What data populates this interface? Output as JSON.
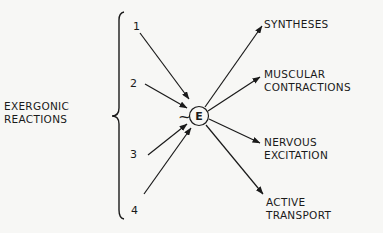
{
  "diagram": {
    "group_label": [
      "EXERGONIC",
      "REACTIONS"
    ],
    "center": {
      "prefix": "~",
      "letter": "E"
    },
    "inputs": [
      "1",
      "2",
      "3",
      "4"
    ],
    "outputs": [
      [
        "SYNTHESES"
      ],
      [
        "MUSCULAR",
        "CONTRACTIONS"
      ],
      [
        "NERVOUS",
        "EXCITATION"
      ],
      [
        "ACTIVE",
        "TRANSPORT"
      ]
    ],
    "colors": {
      "ink": "#1a1a1a",
      "background": "#f7f7f5"
    }
  }
}
